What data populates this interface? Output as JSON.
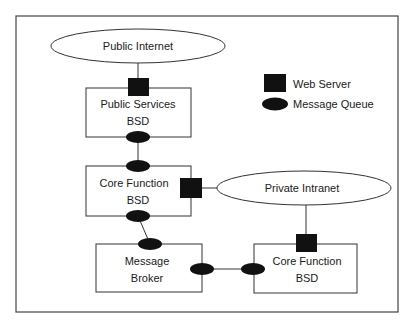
{
  "diagram": {
    "nodes": {
      "public_internet": {
        "label": "Public Internet",
        "kind": "network"
      },
      "public_services": {
        "line1": "Public Services",
        "line2": "BSD",
        "kind": "bsd"
      },
      "core_function_1": {
        "line1": "Core Function",
        "line2": "BSD",
        "kind": "bsd"
      },
      "private_intranet": {
        "label": "Private Intranet",
        "kind": "network"
      },
      "message_broker": {
        "line1": "Message",
        "line2": "Broker",
        "kind": "broker"
      },
      "core_function_2": {
        "line1": "Core Function",
        "line2": "BSD",
        "kind": "bsd"
      }
    },
    "edges": [
      {
        "from": "public_internet",
        "to": "public_services",
        "via": "web-server"
      },
      {
        "from": "public_services",
        "to": "core_function_1",
        "via": "message-queue"
      },
      {
        "from": "core_function_1",
        "to": "private_intranet",
        "via": "web-server"
      },
      {
        "from": "core_function_1",
        "to": "message_broker",
        "via": "message-queue"
      },
      {
        "from": "message_broker",
        "to": "core_function_2",
        "via": "message-queue"
      },
      {
        "from": "private_intranet",
        "to": "core_function_2",
        "via": "web-server"
      }
    ],
    "legend": [
      {
        "icon": "web-server-square",
        "label": "Web Server"
      },
      {
        "icon": "message-queue-ellipse",
        "label": "Message Queue"
      }
    ],
    "colors": {
      "stroke": "#333333",
      "fill_dark": "#111111",
      "background": "#ffffff"
    }
  }
}
